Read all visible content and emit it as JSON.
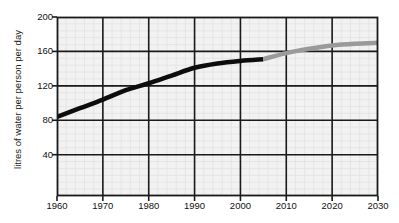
{
  "chart_data": {
    "type": "line",
    "title": "",
    "subtitle": "",
    "xlabel": "",
    "ylabel": "litres of water per person per day",
    "xlim": [
      1960,
      2030
    ],
    "ylim": [
      -8,
      200
    ],
    "ytick_values": [
      200,
      160,
      120,
      80,
      40
    ],
    "ytick_labels": [
      "200",
      "160",
      "120",
      "80",
      "40"
    ],
    "xtick_values": [
      1960,
      1970,
      1980,
      1990,
      2000,
      2010,
      2020,
      2030
    ],
    "xtick_labels": [
      "1960",
      "1970",
      "1980",
      "1990",
      "2000",
      "2010",
      "2020",
      "2030"
    ],
    "grid": true,
    "grid_color": "#1a1a1a",
    "minor_grid": true,
    "minor_grid_color": "#e2e2e2",
    "plot_background": "#f2f2f2",
    "legend": null,
    "legend_position": "none",
    "annotations": [],
    "series": [
      {
        "name": "actual",
        "color": "#0d0d0d",
        "linewidth": 4.5,
        "x": [
          1960,
          1965,
          1970,
          1975,
          1980,
          1985,
          1990,
          1995,
          2000,
          2005
        ],
        "values": [
          84,
          94,
          104,
          115,
          123,
          132,
          141,
          146,
          149,
          151
        ]
      },
      {
        "name": "projected",
        "color": "#9a9a9a",
        "linewidth": 4.5,
        "x": [
          2005,
          2010,
          2015,
          2020,
          2025,
          2030
        ],
        "values": [
          151,
          158,
          163,
          167,
          169,
          170
        ]
      }
    ]
  },
  "axes": {
    "y_title": "litres of water per person per day"
  }
}
